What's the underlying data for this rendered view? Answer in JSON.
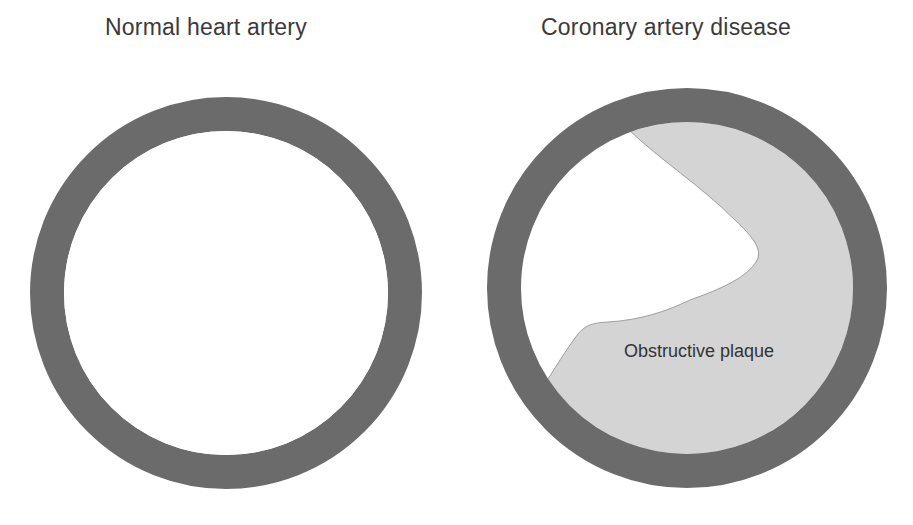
{
  "panels": [
    {
      "title": "Normal heart artery",
      "state": "open lumen",
      "center": [
        226,
        293
      ],
      "outer_radius": 196,
      "wall_thickness": 34
    },
    {
      "title": "Coronary artery disease",
      "state": "partially blocked lumen",
      "center": [
        687,
        288
      ],
      "outer_radius": 200,
      "wall_thickness": 34,
      "annotation": "Obstructive plaque"
    }
  ],
  "colors": {
    "background": "#ffffff",
    "artery_wall": "#6b6b6b",
    "lumen": "#ffffff",
    "plaque": "#d4d4d4",
    "text": "#3a3a3a"
  }
}
